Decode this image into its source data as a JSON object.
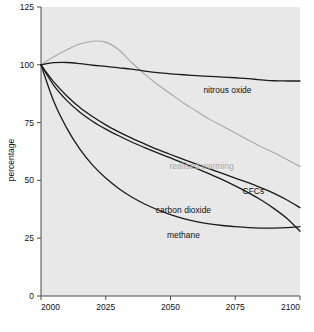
{
  "chart_data": {
    "type": "line",
    "title": "",
    "subtitle": "",
    "xlabel": "",
    "ylabel": "percentage",
    "xlim": [
      2000,
      2100
    ],
    "ylim": [
      0,
      125
    ],
    "xticks": [
      2000,
      2025,
      2050,
      2075,
      2100
    ],
    "xtick_labels": [
      "2000",
      "2025",
      "2050",
      "2075",
      "2100"
    ],
    "yticks": [
      0,
      25,
      50,
      75,
      100,
      125
    ],
    "ytick_labels": [
      "0",
      "25",
      "50",
      "75",
      "100",
      "125"
    ],
    "grid": false,
    "legend": "inline-annotations",
    "plot_background": "#e8e8e8",
    "x": [
      2000,
      2005,
      2010,
      2015,
      2020,
      2025,
      2030,
      2035,
      2040,
      2045,
      2050,
      2055,
      2060,
      2065,
      2070,
      2075,
      2080,
      2085,
      2090,
      2095,
      2100
    ],
    "series": [
      {
        "name": "realised warming",
        "color": "#a8a8a8",
        "label": "realised warming",
        "label_x": 2062,
        "label_y": 55,
        "values": [
          100,
          103.5,
          106.5,
          109,
          110.2,
          109.8,
          106.5,
          101,
          96,
          91.5,
          87.5,
          83.5,
          80,
          76.5,
          73.5,
          70.5,
          67.5,
          64.5,
          62,
          59,
          56
        ]
      },
      {
        "name": "nitrous oxide",
        "color": "#1a1a1a",
        "label": "nitrous oxide",
        "label_x": 2072,
        "label_y": 88,
        "values": [
          100,
          100.9,
          101,
          100.5,
          99.8,
          99.3,
          98.7,
          98.1,
          97.3,
          96.6,
          96.1,
          95.7,
          95.3,
          95.0,
          94.7,
          94.4,
          94.0,
          93.5,
          93.1,
          93.0,
          93.0
        ]
      },
      {
        "name": "CFCs",
        "color": "#1a1a1a",
        "label": "CFCs",
        "label_x": 2082,
        "label_y": 44,
        "values": [
          100,
          92.5,
          86.5,
          81.5,
          77.5,
          74.0,
          71.0,
          68.3,
          65.8,
          63.4,
          61.2,
          59.1,
          57.0,
          55.0,
          53.0,
          51.0,
          49.0,
          46.8,
          44.4,
          41.5,
          38.2
        ]
      },
      {
        "name": "carbon dioxide",
        "color": "#1a1a1a",
        "label": "carbon dioxide",
        "label_x": 2055,
        "label_y": 36,
        "values": [
          100,
          91.0,
          84.5,
          79.5,
          75.5,
          72.2,
          69.3,
          66.6,
          64.2,
          61.9,
          59.7,
          57.5,
          55.2,
          52.8,
          50.3,
          47.6,
          44.7,
          41.5,
          37.8,
          33.5,
          28.0
        ]
      },
      {
        "name": "methane",
        "color": "#1a1a1a",
        "label": "methane",
        "label_x": 2055,
        "label_y": 25,
        "values": [
          100,
          84.0,
          72.5,
          63.5,
          56.5,
          51.0,
          46.5,
          42.8,
          39.8,
          37.3,
          35.2,
          33.5,
          32.2,
          31.2,
          30.5,
          30.0,
          29.6,
          29.4,
          29.4,
          29.6,
          30.0
        ]
      }
    ]
  }
}
